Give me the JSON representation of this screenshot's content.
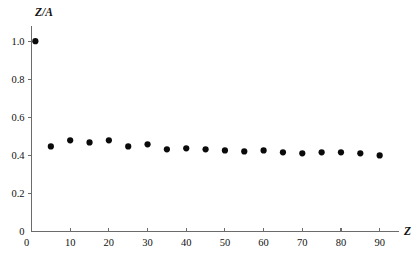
{
  "chart_data": {
    "type": "scatter",
    "title": "",
    "xlabel": "Z",
    "ylabel": "Z/A",
    "xlim": [
      0,
      95
    ],
    "ylim": [
      0,
      1.08
    ],
    "grid": false,
    "legend": null,
    "x_ticks": [
      0,
      10,
      20,
      30,
      40,
      50,
      60,
      70,
      80,
      90
    ],
    "x_tick_labels": [
      "0",
      "10",
      "20",
      "30",
      "40",
      "50",
      "60",
      "70",
      "80",
      "90"
    ],
    "y_ticks": [
      0,
      0.2,
      0.4,
      0.6,
      0.8,
      1.0
    ],
    "y_tick_labels": [
      "0",
      "0.2",
      "0.4",
      "0.6",
      "0.8",
      "1.0"
    ],
    "marker": "filled-circle",
    "marker_color": "#0a0a0a",
    "marker_size": 3.1,
    "axis_color": "#6b6b6b",
    "background_color": "#ffffff",
    "x": [
      1,
      5,
      10,
      15,
      20,
      25,
      30,
      35,
      40,
      45,
      50,
      55,
      60,
      65,
      70,
      75,
      80,
      85,
      90
    ],
    "y": [
      1.0,
      0.447,
      0.479,
      0.468,
      0.479,
      0.447,
      0.458,
      0.432,
      0.437,
      0.432,
      0.426,
      0.421,
      0.426,
      0.416,
      0.411,
      0.416,
      0.416,
      0.411,
      0.4
    ],
    "series_name": "Z/A vs Z"
  },
  "axes": {
    "y_title": "Z/A",
    "x_title": "Z"
  }
}
